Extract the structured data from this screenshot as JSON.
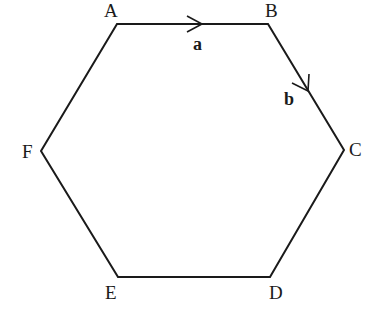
{
  "diagram": {
    "type": "regular hexagon with vectors",
    "stroke_color": "#1a1a1a",
    "vertices": [
      {
        "label": "A",
        "x": 117,
        "y": 24
      },
      {
        "label": "B",
        "x": 268,
        "y": 24
      },
      {
        "label": "C",
        "x": 344,
        "y": 150
      },
      {
        "label": "D",
        "x": 270,
        "y": 277
      },
      {
        "label": "E",
        "x": 118,
        "y": 277
      },
      {
        "label": "F",
        "x": 41,
        "y": 151
      }
    ],
    "vectors": [
      {
        "label": "a",
        "from": "A",
        "to": "B"
      },
      {
        "label": "b",
        "from": "B",
        "to": "C"
      }
    ]
  }
}
